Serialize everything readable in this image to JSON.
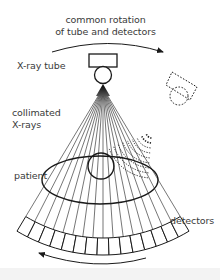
{
  "labels": {
    "rotation_line1": "common rotation",
    "rotation_line2": "of tube and detectors",
    "xray_tube": "X-ray tube",
    "collimated_line1": "collimated",
    "collimated_line2": "X-rays",
    "patient": "patient",
    "detectors": "detectors"
  },
  "colors": {
    "stroke": "#1a1a1a",
    "text": "#3a3a3a",
    "background": "#ffffff"
  },
  "geometry": {
    "focal_point": [
      103,
      88
    ],
    "beam_count": 17,
    "detector_count": 15
  }
}
